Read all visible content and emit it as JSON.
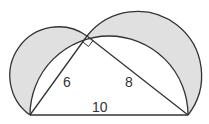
{
  "diagram": {
    "type": "geometry",
    "labels": {
      "leg_left": "6",
      "leg_right": "8",
      "hypotenuse": "10"
    },
    "colors": {
      "stroke": "#333333",
      "lune_fill": "#e0e0e0",
      "background": "#ffffff"
    },
    "right_angle_marker": true
  }
}
